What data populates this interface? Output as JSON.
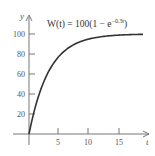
{
  "chart_data": {
    "type": "line",
    "formula": {
      "lhs": "W(t) = 100(1 − e",
      "exponent": "−0.3t",
      "rhs": ")"
    },
    "function": "100*(1-exp(-0.3*t))",
    "xlabel": "t",
    "ylabel": "y",
    "xlim": [
      0,
      19
    ],
    "ylim": [
      0,
      110
    ],
    "x_ticks": [
      5,
      10,
      15
    ],
    "x_tick_labels": [
      "5",
      "10",
      "15"
    ],
    "y_ticks": [
      20,
      40,
      60,
      80,
      100
    ],
    "y_tick_labels": [
      "20",
      "40",
      "60",
      "80",
      "100"
    ],
    "grid": false,
    "legend": null,
    "series": [
      {
        "name": "W(t)",
        "x": [
          0,
          1,
          2,
          3,
          4,
          5,
          6,
          8,
          10,
          12,
          15,
          19
        ],
        "values": [
          0,
          25.9,
          45.1,
          59.3,
          69.9,
          77.7,
          83.5,
          90.9,
          95.0,
          97.3,
          98.9,
          99.7
        ]
      }
    ],
    "colors": {
      "curve": "#333333",
      "axes": "#666666",
      "text": "#555555"
    }
  }
}
